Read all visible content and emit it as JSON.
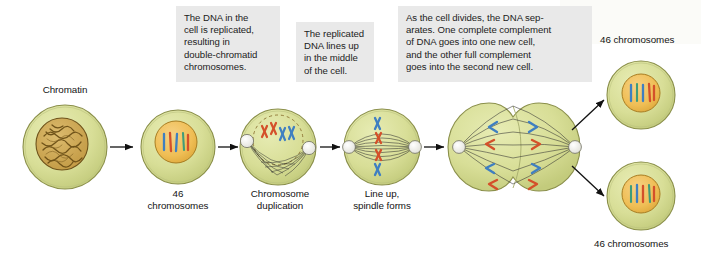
{
  "figure": {
    "background": "#ffffff",
    "caption_bg": "#e9e9e9",
    "cell_fill": "#d6dd96",
    "cell_stroke": "#8a8f4a",
    "nucleus_fill": "#f0c05a",
    "nucleus_stroke": "#9a7320",
    "chromatin_fill": "#c8a14a",
    "chromatin_stroke": "#7a5a18",
    "chromosome_blue": "#3f7fc1",
    "chromosome_red": "#d4502a",
    "spindle_color": "#2e2e2e",
    "centrosome_fill": "#f2f2ef",
    "arrow_color": "#111111"
  },
  "captions": [
    {
      "id": "caption-replication",
      "text": "The DNA in the\ncell is replicated,\nresulting in\ndouble-chromatid\nchromosomes."
    },
    {
      "id": "caption-lineup",
      "text": "The replicated\nDNA lines up\nin the middle\nof the cell."
    },
    {
      "id": "caption-separation",
      "text": "As the cell divides, the DNA sep-\narates. One complete complement\nof DNA goes into one new cell,\nand the other full complement\ngoes into the second new cell."
    }
  ],
  "labels": {
    "chromatin": "Chromatin",
    "stage2": "46\nchromosomes",
    "stage3": "Chromosome\nduplication",
    "stage4": "Line up,\nspindle forms",
    "daughter_top": "46 chromosomes",
    "daughter_bottom": "46 chromosomes"
  },
  "stages": [
    {
      "id": "stage-chromatin",
      "label": "Chromatin",
      "description": "Interphase cell with tangled chromatin in nucleus",
      "chromosome_count": null
    },
    {
      "id": "stage-46-chromosomes",
      "label": "46 chromosomes",
      "description": "Nucleus with distinct condensed chromosomes",
      "chromosome_count": 46
    },
    {
      "id": "stage-chromosome-duplication",
      "label": "Chromosome duplication",
      "description": "Double-chromatid X-shaped chromosomes, spindle forming from centrosomes",
      "chromosome_count": 46
    },
    {
      "id": "stage-line-up-spindle-forms",
      "label": "Line up, spindle forms",
      "description": "Chromosomes aligned at the metaphase plate between two spindle poles",
      "chromosome_count": 46
    },
    {
      "id": "stage-cell-divides",
      "label": "",
      "description": "Cell pinching into two, chromosomes pulled to opposite poles",
      "chromosome_count": 46
    },
    {
      "id": "stage-daughter-cell-top",
      "label": "46 chromosomes",
      "description": "New daughter cell with full complement of DNA",
      "chromosome_count": 46
    },
    {
      "id": "stage-daughter-cell-bottom",
      "label": "46 chromosomes",
      "description": "Second new daughter cell with full complement of DNA",
      "chromosome_count": 46
    }
  ]
}
